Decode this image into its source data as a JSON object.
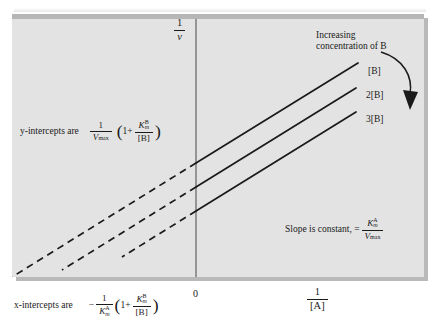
{
  "figure": {
    "type": "lineweaver-burk-double-reciprocal-plot",
    "panel_background": "#e3e3e3",
    "line_color": "#1a1a1a"
  },
  "axes": {
    "y_axis_title": {
      "numerator": "1",
      "denominator": "v"
    },
    "x_axis_title": {
      "numerator": "1",
      "denominator": "[A]"
    },
    "origin_label": "0"
  },
  "annotations": {
    "increasing_line1": "Increasing",
    "increasing_line2": "concentration of B",
    "slope_prefix": "Slope is constant, =",
    "slope_fraction": {
      "numerator_K": "K",
      "numerator_sub": "m",
      "numerator_sup": "A",
      "denominator_V": "V",
      "denominator_sub": "max"
    },
    "y_intercepts_prefix": "y-intercepts are",
    "y_intercepts_formula": {
      "frac_num": "1",
      "frac_den_V": "V",
      "frac_den_sub": "max",
      "one_plus": "1+",
      "K": "K",
      "K_sub": "m",
      "K_sup": "B",
      "over": "[B]"
    },
    "x_intercepts_prefix": "x-intercepts are",
    "x_intercepts_formula": {
      "minus": "−",
      "frac_num": "1",
      "frac_den_K": "K",
      "frac_den_sub": "m",
      "frac_den_sup": "A",
      "one_plus": "1+",
      "K": "K",
      "K_sub": "m",
      "K_sup": "B",
      "over": "[B]"
    }
  },
  "curves": [
    {
      "label": "[B]",
      "name": "line-b",
      "solid": {
        "x1": 196,
        "y1": 163,
        "x2": 358,
        "y2": 63
      },
      "dashed": {
        "x1": 196,
        "y1": 163,
        "x2": 1,
        "y2": 283
      }
    },
    {
      "label": "2[B]",
      "name": "line-2b",
      "solid": {
        "x1": 196,
        "y1": 187,
        "x2": 356,
        "y2": 88
      },
      "dashed": {
        "x1": 196,
        "y1": 187,
        "x2": 62,
        "y2": 270
      }
    },
    {
      "label": "3[B]",
      "name": "line-3b",
      "solid": {
        "x1": 196,
        "y1": 211,
        "x2": 356,
        "y2": 112
      },
      "dashed": {
        "x1": 196,
        "y1": 211,
        "x2": 122,
        "y2": 257
      }
    }
  ],
  "arrow": {
    "name": "increasing-concentration-arrow",
    "path": "M 381 52 C 404 58, 414 76, 411 92"
  }
}
